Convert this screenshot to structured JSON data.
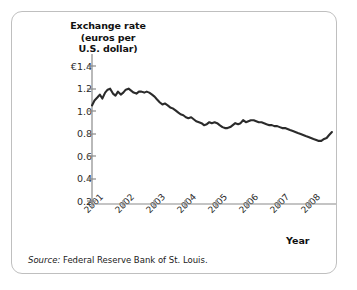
{
  "figure": {
    "source_lead": "Source:",
    "source_text": "Federal Reserve Bank of St. Louis.",
    "frame_color": "#bfbfbf",
    "background": "#ffffff"
  },
  "chart_data": {
    "type": "line",
    "title": "",
    "ylabel": "Exchange rate (euros per U.S. dollar)",
    "ylabel_lines": [
      "Exchange rate",
      "(euros per",
      "U.S. dollar)"
    ],
    "xlabel": "Year",
    "line_color": "#2b2b2b",
    "axis_color": "#808080",
    "grid": false,
    "legend": false,
    "ylim": [
      0,
      1.4
    ],
    "yticks": [
      1.4,
      1.2,
      1.0,
      0.8,
      0.6,
      0.4,
      0.2
    ],
    "ytick_labels": [
      "€1.4",
      "1.2",
      "1.0",
      "0.8",
      "0.6",
      "0.4",
      "0.2"
    ],
    "xlim": [
      2001.0,
      2008.8
    ],
    "xticks": [
      2001,
      2002,
      2003,
      2004,
      2005,
      2006,
      2007,
      2008
    ],
    "xtick_labels": [
      "2001",
      "2002",
      "2003",
      "2004",
      "2005",
      "2006",
      "2007",
      "2008"
    ],
    "x": [
      2001.0,
      2001.08,
      2001.17,
      2001.25,
      2001.33,
      2001.42,
      2001.5,
      2001.58,
      2001.67,
      2001.75,
      2001.83,
      2001.92,
      2002.0,
      2002.08,
      2002.17,
      2002.25,
      2002.33,
      2002.42,
      2002.5,
      2002.58,
      2002.67,
      2002.75,
      2002.83,
      2002.92,
      2003.0,
      2003.08,
      2003.17,
      2003.25,
      2003.33,
      2003.42,
      2003.5,
      2003.58,
      2003.67,
      2003.75,
      2003.83,
      2003.92,
      2004.0,
      2004.08,
      2004.17,
      2004.25,
      2004.33,
      2004.42,
      2004.5,
      2004.58,
      2004.67,
      2004.75,
      2004.83,
      2004.92,
      2005.0,
      2005.08,
      2005.17,
      2005.25,
      2005.33,
      2005.42,
      2005.5,
      2005.58,
      2005.67,
      2005.75,
      2005.83,
      2005.92,
      2006.0,
      2006.08,
      2006.17,
      2006.25,
      2006.33,
      2006.42,
      2006.5,
      2006.58,
      2006.67,
      2006.75,
      2006.83,
      2006.92,
      2007.0,
      2007.08,
      2007.17,
      2007.25,
      2007.33,
      2007.42,
      2007.5,
      2007.58,
      2007.67,
      2007.75,
      2007.83,
      2007.92,
      2008.0,
      2008.08,
      2008.17,
      2008.25,
      2008.33,
      2008.42,
      2008.5,
      2008.58,
      2008.67
    ],
    "y": [
      1.0,
      1.05,
      1.08,
      1.11,
      1.07,
      1.13,
      1.16,
      1.17,
      1.12,
      1.1,
      1.14,
      1.11,
      1.13,
      1.16,
      1.17,
      1.15,
      1.13,
      1.12,
      1.14,
      1.14,
      1.13,
      1.14,
      1.13,
      1.11,
      1.09,
      1.06,
      1.03,
      1.01,
      1.02,
      1.0,
      0.98,
      0.97,
      0.95,
      0.93,
      0.91,
      0.9,
      0.88,
      0.87,
      0.88,
      0.86,
      0.84,
      0.83,
      0.82,
      0.8,
      0.81,
      0.83,
      0.82,
      0.83,
      0.82,
      0.8,
      0.78,
      0.77,
      0.77,
      0.78,
      0.8,
      0.82,
      0.81,
      0.82,
      0.85,
      0.83,
      0.84,
      0.85,
      0.85,
      0.84,
      0.83,
      0.83,
      0.82,
      0.81,
      0.8,
      0.8,
      0.79,
      0.79,
      0.78,
      0.77,
      0.77,
      0.76,
      0.75,
      0.74,
      0.73,
      0.72,
      0.71,
      0.7,
      0.69,
      0.68,
      0.67,
      0.66,
      0.65,
      0.64,
      0.64,
      0.66,
      0.67,
      0.7,
      0.73
    ]
  }
}
